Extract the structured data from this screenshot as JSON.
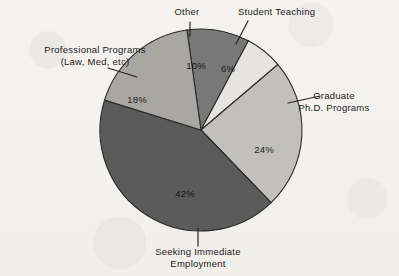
{
  "chart_data": {
    "type": "pie",
    "title": "",
    "subtitle": "",
    "xlabel": "",
    "ylabel": "",
    "legend_position": "callout-labels",
    "grid": false,
    "total": 100,
    "unit": "%",
    "categories": [
      "Other",
      "Student Teaching",
      "Graduate Ph.D. Programs",
      "Seeking Immediate Employment",
      "Professional Programs (Law, Med, etc)"
    ],
    "values": [
      10,
      6,
      24,
      42,
      18
    ],
    "slices": [
      {
        "name": "other",
        "label_line1": "Other",
        "label_line2": "",
        "value": 10,
        "value_label": "10%",
        "color": "#787878",
        "start_angle": -8,
        "end_angle": 28
      },
      {
        "name": "student-teaching",
        "label_line1": "Student Teaching",
        "label_line2": "",
        "value": 6,
        "value_label": "6%",
        "color": "#e6e4e0",
        "start_angle": 28,
        "end_angle": 49.6
      },
      {
        "name": "graduate-phd-programs",
        "label_line1": "Graduate",
        "label_line2": "Ph.D. Programs",
        "value": 24,
        "value_label": "24%",
        "color": "#c2c0bc",
        "start_angle": 49.6,
        "end_angle": 136
      },
      {
        "name": "seeking-immediate-employment",
        "label_line1": "Seeking Immediate",
        "label_line2": "Employment",
        "value": 42,
        "value_label": "42%",
        "color": "#5b5b5b",
        "start_angle": 136,
        "end_angle": 287.2
      },
      {
        "name": "professional-programs",
        "label_line1": "Professional Programs",
        "label_line2": "(Law, Med, etc)",
        "value": 18,
        "value_label": "18%",
        "color": "#a9a7a3",
        "start_angle": 287.2,
        "end_angle": 352
      }
    ]
  },
  "pie": {
    "center_x": 201,
    "center_y": 130,
    "radius": 101,
    "outline_color": "#2a2a2a",
    "background_color": "#f3f1ee"
  },
  "percent_labels": {
    "other": {
      "text": "10%",
      "x": 196,
      "y": 66
    },
    "student_teaching": {
      "text": "6%",
      "x": 228,
      "y": 69
    },
    "graduate": {
      "text": "24%",
      "x": 264,
      "y": 150
    },
    "seeking": {
      "text": "42%",
      "x": 185,
      "y": 194
    },
    "professional": {
      "text": "18%",
      "x": 137,
      "y": 100
    }
  },
  "callouts": {
    "other": {
      "line1": "Other",
      "line2": "",
      "text_x": 187,
      "text_y1": 15,
      "text_y2": 0,
      "anchor": "middle",
      "leader": {
        "x1": 190,
        "y1": 22,
        "x2": 190,
        "y2": 36
      }
    },
    "student_teaching": {
      "line1": "Student Teaching",
      "line2": "",
      "text_x": 238,
      "text_y1": 15,
      "text_y2": 0,
      "anchor": "start",
      "leader": {
        "x1": 248,
        "y1": 21,
        "x2": 236,
        "y2": 44
      }
    },
    "graduate": {
      "line1": "Graduate",
      "line2": "Ph.D. Programs",
      "text_x": 334,
      "text_y1": 99,
      "text_y2": 111,
      "anchor": "middle",
      "leader": {
        "x1": 288,
        "y1": 103,
        "x2": 320,
        "y2": 96
      }
    },
    "seeking": {
      "line1": "Seeking Immediate",
      "line2": "Employment",
      "text_x": 198,
      "text_y1": 255,
      "text_y2": 267,
      "anchor": "middle",
      "leader": {
        "x1": 198,
        "y1": 228,
        "x2": 198,
        "y2": 246
      }
    },
    "professional": {
      "line1": "Professional Programs",
      "line2": "(Law, Med, etc)",
      "text_x": 95,
      "text_y1": 53,
      "text_y2": 65,
      "anchor": "middle",
      "leader": {
        "x1": 137,
        "y1": 77,
        "x2": 108,
        "y2": 68
      }
    }
  }
}
